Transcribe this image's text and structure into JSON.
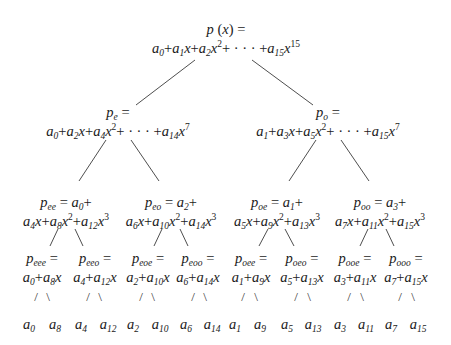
{
  "diagram": {
    "root": {
      "label": "p(x) =",
      "formula_terms": [
        "a_0",
        "+a_1 x",
        "+a_2 x^2",
        "+ · · · +a_15 x^15"
      ]
    },
    "level1": [
      {
        "name": "p_e",
        "label_sub": "e",
        "formula": "a_0+a_2x+a_4x^2+ · · · +a_14x^7"
      },
      {
        "name": "p_o",
        "label_sub": "o",
        "formula": "a_1+a_3x+a_5x^2+ · · · +a_15x^7"
      }
    ],
    "level2": [
      {
        "label_sub": "ee",
        "first": "a_0+",
        "formula": "a_4x+a_8x^2+a_12x^3"
      },
      {
        "label_sub": "eo",
        "first": "a_2+",
        "formula": "a_6x+a_10x^2+a_14x^3"
      },
      {
        "label_sub": "oe",
        "first": "a_1+",
        "formula": "a_5x+a_9x^2+a_13x^3"
      },
      {
        "label_sub": "oo",
        "first": "a_3+",
        "formula": "a_7x+a_11x^2+a_15x^3"
      }
    ],
    "level3": [
      {
        "label_sub": "eee",
        "formula": "a_0+a_8x"
      },
      {
        "label_sub": "eeo",
        "formula": "a_4+a_12x"
      },
      {
        "label_sub": "eoe",
        "formula": "a_2+a_10x"
      },
      {
        "label_sub": "eoo",
        "formula": "a_6+a_14x"
      },
      {
        "label_sub": "oee",
        "formula": "a_1+a_9x"
      },
      {
        "label_sub": "oeo",
        "formula": "a_5+a_13x"
      },
      {
        "label_sub": "ooe",
        "formula": "a_3+a_11x"
      },
      {
        "label_sub": "ooo",
        "formula": "a_7+a_15x"
      }
    ],
    "leaves": [
      "0",
      "8",
      "4",
      "12",
      "2",
      "10",
      "6",
      "14",
      "1",
      "9",
      "5",
      "13",
      "3",
      "11",
      "7",
      "15"
    ],
    "text": {
      "p": "p",
      "a": "a",
      "x": "x",
      "eq": " =",
      "plus": "+",
      "dots": "+ · · · +",
      "open_paren": " (",
      "close_paren": ") =",
      "slash": "/",
      "backslash": "\\"
    },
    "line_color": "#3a3a3a"
  }
}
